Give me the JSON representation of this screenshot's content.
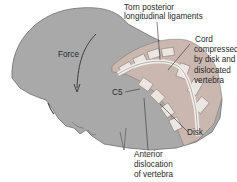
{
  "diagram": {
    "type": "anatomical-illustration",
    "labels": {
      "force": "Force",
      "torn_ligaments_line1": "Torn posterior",
      "torn_ligaments_line2": "longitudinal ligaments",
      "cord_line1": "Cord",
      "cord_line2": "compressed",
      "cord_line3": "by disk and",
      "cord_line4": "dislocated",
      "cord_line5": "vertebra",
      "c5": "C5",
      "disk": "Disk",
      "anterior_line1": "Anterior",
      "anterior_line2": "dislocation",
      "anterior_line3": "of vertebra"
    },
    "colors": {
      "head": "#a9a9a9",
      "head_outline": "#6e6e6e",
      "spine_bg": "#c9b7b0",
      "vertebra": "#ece6e2",
      "disk": "#d8cfc9",
      "line": "#333333",
      "text": "#2a2a2a"
    }
  }
}
